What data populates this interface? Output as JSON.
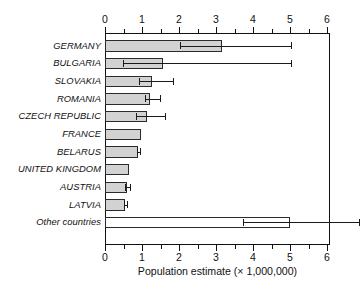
{
  "chart_data": {
    "type": "bar",
    "orientation": "horizontal",
    "title": "",
    "xlabel": "Population estimate (× 1,000,000)",
    "ylabel": "",
    "xlim": [
      0,
      6.08
    ],
    "xticks": [
      0,
      1,
      2,
      3,
      4,
      5,
      6
    ],
    "xtick_labels": [
      "0",
      "1",
      "2",
      "3",
      "4",
      "5",
      "6"
    ],
    "minor_tick_step": 0.5,
    "grid": false,
    "legend": null,
    "axis_positions": [
      "top",
      "bottom"
    ],
    "categories": [
      "GERMANY",
      "BULGARIA",
      "SLOVAKIA",
      "ROMANIA",
      "CZECH REPUBLIC",
      "FRANCE",
      "BELARUS",
      "UNITED KINGDOM",
      "AUSTRIA",
      "LATVIA",
      "Other countries"
    ],
    "values": [
      3.15,
      1.55,
      1.25,
      1.2,
      1.12,
      0.97,
      0.88,
      0.65,
      0.57,
      0.52,
      4.98
    ],
    "error_low": [
      2.0,
      0.45,
      0.9,
      1.05,
      0.8,
      null,
      0.85,
      null,
      0.5,
      0.48,
      3.7
    ],
    "error_high": [
      5.0,
      5.0,
      1.8,
      1.45,
      1.6,
      null,
      0.92,
      null,
      0.65,
      0.57,
      6.85
    ],
    "bar_fill": "#d2d2d2",
    "bar_fill_other": "#ffffff",
    "bar_edge": "#2b2b2b",
    "bars": [
      {
        "label": "GERMANY",
        "value": 3.15,
        "err_low": 2.0,
        "err_high": 5.0,
        "filled": true
      },
      {
        "label": "BULGARIA",
        "value": 1.55,
        "err_low": 0.45,
        "err_high": 5.0,
        "filled": true
      },
      {
        "label": "SLOVAKIA",
        "value": 1.25,
        "err_low": 0.9,
        "err_high": 1.8,
        "filled": true
      },
      {
        "label": "ROMANIA",
        "value": 1.2,
        "err_low": 1.05,
        "err_high": 1.45,
        "filled": true
      },
      {
        "label": "CZECH REPUBLIC",
        "value": 1.12,
        "err_low": 0.8,
        "err_high": 1.6,
        "filled": true
      },
      {
        "label": "FRANCE",
        "value": 0.97,
        "err_low": null,
        "err_high": null,
        "filled": true
      },
      {
        "label": "BELARUS",
        "value": 0.88,
        "err_low": 0.85,
        "err_high": 0.92,
        "filled": true
      },
      {
        "label": "UNITED KINGDOM",
        "value": 0.65,
        "err_low": null,
        "err_high": null,
        "filled": true
      },
      {
        "label": "AUSTRIA",
        "value": 0.57,
        "err_low": 0.5,
        "err_high": 0.65,
        "filled": true
      },
      {
        "label": "LATVIA",
        "value": 0.52,
        "err_low": 0.48,
        "err_high": 0.57,
        "filled": true
      },
      {
        "label": "Other countries",
        "value": 4.98,
        "err_low": 3.7,
        "err_high": 6.85,
        "filled": false
      }
    ]
  }
}
